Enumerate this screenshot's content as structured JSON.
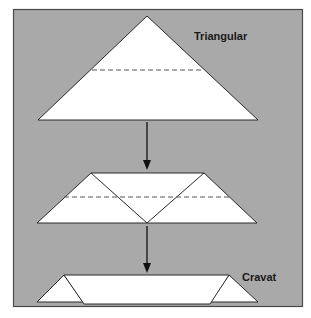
{
  "figure": {
    "background_color": "#a9a9a9",
    "shape_fill": "#ffffff",
    "line_color": "#2a2a2a",
    "dash_color": "#555555",
    "steps": [
      {
        "id": "triangular",
        "label": "Triangular"
      },
      {
        "id": "folded",
        "label": ""
      },
      {
        "id": "cravat",
        "label": "Cravat"
      }
    ],
    "arrows": [
      {
        "from": "triangular",
        "to": "folded"
      },
      {
        "from": "folded",
        "to": "cravat"
      }
    ]
  }
}
